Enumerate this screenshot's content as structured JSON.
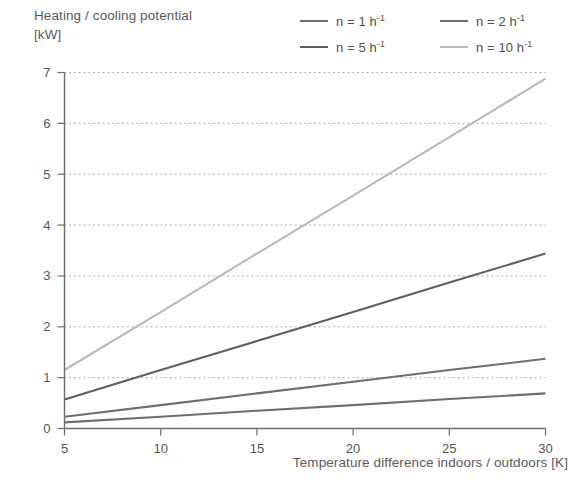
{
  "chart_data": {
    "type": "line",
    "title_line1": "Heating / cooling potential",
    "title_line2": "[kW]",
    "xlabel": "Temperature difference indoors / outdoors [K]",
    "ylabel": "Heating / cooling potential [kW]",
    "xlim": [
      5,
      30
    ],
    "ylim": [
      0,
      7
    ],
    "xticks": [
      5,
      10,
      15,
      20,
      25,
      30
    ],
    "yticks": [
      0,
      1,
      2,
      3,
      4,
      5,
      6,
      7
    ],
    "xtick_labels": [
      "5",
      "10",
      "15",
      "20",
      "25",
      "30"
    ],
    "ytick_labels": [
      "0",
      "1",
      "2",
      "3",
      "4",
      "5",
      "6",
      "7"
    ],
    "grid": "horizontal-dotted",
    "legend_position": "top-right",
    "x": [
      5,
      10,
      15,
      20,
      25,
      30
    ],
    "series": [
      {
        "name": "n = 1 h-1",
        "label_prefix": "n = 1 h",
        "label_exponent": "-1",
        "color": "#6e6e6e",
        "values": [
          0.12,
          0.23,
          0.35,
          0.46,
          0.58,
          0.69
        ]
      },
      {
        "name": "n = 2 h-1",
        "label_prefix": "n = 2 h",
        "label_exponent": "-1",
        "color": "#6e6e6e",
        "values": [
          0.23,
          0.46,
          0.69,
          0.92,
          1.15,
          1.37
        ]
      },
      {
        "name": "n = 5 h-1",
        "label_prefix": "n = 5 h",
        "label_exponent": "-1",
        "color": "#5f5f5f",
        "values": [
          0.57,
          1.15,
          1.72,
          2.29,
          2.87,
          3.44
        ]
      },
      {
        "name": "n = 10 h-1",
        "label_prefix": "n = 10 h",
        "label_exponent": "-1",
        "color": "#b9b9b9",
        "values": [
          1.15,
          2.29,
          3.44,
          4.58,
          5.73,
          6.88
        ]
      }
    ]
  },
  "legend": {
    "items": [
      {
        "label_prefix": "n = 1 h",
        "label_exponent": "-1",
        "color": "#6e6e6e"
      },
      {
        "label_prefix": "n = 2 h",
        "label_exponent": "-1",
        "color": "#6e6e6e"
      },
      {
        "label_prefix": "n = 5 h",
        "label_exponent": "-1",
        "color": "#5f5f5f"
      },
      {
        "label_prefix": "n = 10 h",
        "label_exponent": "-1",
        "color": "#b9b9b9"
      }
    ]
  },
  "axes": {
    "y_title_line1": "Heating / cooling potential",
    "y_title_line2": "[kW]",
    "x_title": "Temperature difference indoors / outdoors [K]"
  },
  "colors": {
    "axis": "#6b6b6b",
    "grid": "#9a9a9a",
    "text": "#555555",
    "background": "#ffffff"
  }
}
